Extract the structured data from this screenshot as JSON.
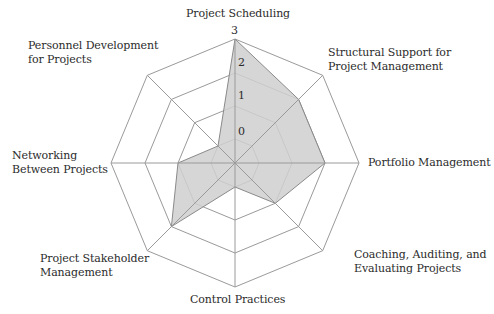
{
  "chart_data": {
    "type": "radar",
    "title": "",
    "axes": [
      "Project Scheduling",
      "Structural Support for Project Management",
      "Portfolio Management",
      "Coaching, Auditing, and Evaluating Projects",
      "Control Practices",
      "Project Stakeholder Management",
      "Networking Between Projects",
      "Personnel Development for Projects"
    ],
    "series": [
      {
        "name": "Score",
        "values": [
          3,
          2,
          2,
          1,
          0,
          2,
          1,
          0
        ]
      }
    ],
    "scale": {
      "min": 0,
      "max": 3,
      "ticks": [
        "0",
        "1",
        "2",
        "3"
      ]
    },
    "grid": "octagonal rings",
    "legend": "none",
    "colors": {
      "fill": "#cfcfcf",
      "line": "#8a8a8a",
      "grid": "#9a9a9a"
    }
  },
  "labels": {
    "top": [
      "Project Scheduling"
    ],
    "ne": [
      "Structural Support for",
      "Project Management"
    ],
    "e": [
      "Portfolio Management"
    ],
    "se": [
      "Coaching, Auditing, and",
      "Evaluating Projects"
    ],
    "s": [
      "Control Practices"
    ],
    "sw": [
      "Project Stakeholder",
      "Management"
    ],
    "w": [
      "Networking",
      "Between Projects"
    ],
    "nw": [
      "Personnel Development",
      "for Projects"
    ]
  },
  "ticks": {
    "t0": "0",
    "t1": "1",
    "t2": "2",
    "t3": "3"
  }
}
